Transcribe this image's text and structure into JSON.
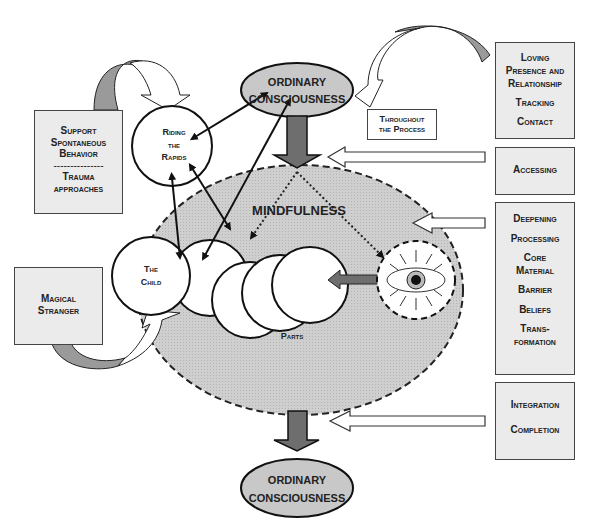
{
  "diagram": {
    "top_node": {
      "line1": "ORDINARY",
      "line2": "CONSCIOUSNESS"
    },
    "bottom_node": {
      "line1": "ORDINARY",
      "line2": "CONSCIOUSNESS"
    },
    "mindfulness_label": "MINDFULNESS",
    "parts_label": "Parts",
    "child_node": {
      "line1": "The",
      "line2": "Child"
    },
    "riding_node": {
      "line1": "Riding",
      "line2": "the",
      "line3": "Rapids"
    },
    "throughout_box": {
      "line1": "Throughout",
      "line2": "the Process"
    },
    "left_boxes": {
      "support": {
        "line1": "Support",
        "line2": "Spontaneous",
        "line3": "Behavior",
        "divider": "---------------",
        "line4": "Trauma",
        "line5": "approaches"
      },
      "magical": {
        "line1": "Magical",
        "line2": "Stranger"
      }
    },
    "right_boxes": {
      "loving": {
        "items": [
          "Loving",
          "Presence and",
          "Relationship",
          "Tracking",
          "Contact"
        ]
      },
      "accessing": {
        "items": [
          "Accessing"
        ]
      },
      "deepening": {
        "items": [
          "Deepening",
          "Processing",
          "Core",
          "Material",
          "Barrier",
          "Beliefs",
          "Trans-",
          "formation"
        ]
      },
      "integration": {
        "items": [
          "Integration",
          "Completion"
        ]
      }
    },
    "icons": {
      "observer": "eye-icon"
    },
    "colors": {
      "ellipse_fill": "#c8c8c8",
      "box_fill": "#ebebeb",
      "arrow_dark": "#6e6e6e",
      "stroke": "#222222"
    }
  }
}
